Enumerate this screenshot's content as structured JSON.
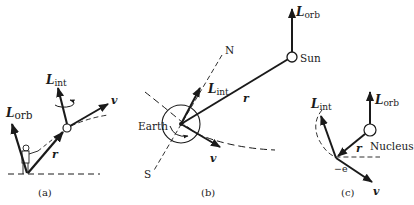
{
  "panels": {
    "a": {
      "caption": "(a)",
      "L_orb": {
        "main": "L",
        "sub": "orb"
      },
      "L_int": {
        "main": "L",
        "sub": "int"
      },
      "r": "r",
      "v": "v"
    },
    "b": {
      "caption": "(b)",
      "earth_label": "Earth",
      "sun_label": "Sun",
      "north_label": "N",
      "south_label": "S",
      "L_orb": {
        "main": "L",
        "sub": "orb"
      },
      "L_int": {
        "main": "L",
        "sub": "int"
      },
      "r": "r",
      "v": "v"
    },
    "c": {
      "caption": "(c)",
      "nucleus_label": "Nucleus",
      "electron_label": "−e",
      "L_orb": {
        "main": "L",
        "sub": "orb"
      },
      "L_int": {
        "main": "L",
        "sub": "int"
      },
      "r": "r",
      "v": "v"
    }
  },
  "colors": {
    "ink": "#1a1a1a",
    "background": "#ffffff"
  }
}
